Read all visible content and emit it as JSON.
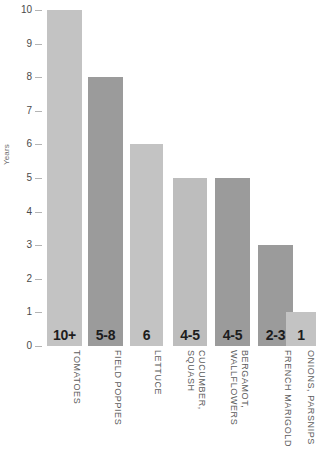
{
  "chart_data": {
    "type": "bar",
    "title": "",
    "xlabel": "",
    "ylabel": "Years",
    "ylim": [
      0,
      10
    ],
    "grid": false,
    "legend": "none",
    "y_ticks": [
      "10",
      "9",
      "8",
      "7",
      "6",
      "5",
      "4",
      "3",
      "2",
      "1",
      "0"
    ],
    "categories": [
      "TOMATOES",
      "FIELD POPPIES",
      "LETTUCE",
      "CUCUMBER, SQUASH",
      "BERGAMOT, WALLFLOWERS",
      "FRENCH MARIGOLD",
      "ONIONS, PARSNIPS"
    ],
    "category_lines": [
      [
        "TOMATOES"
      ],
      [
        "FIELD POPPIES"
      ],
      [
        "LETTUCE"
      ],
      [
        "CUCUMBER,",
        "SQUASH"
      ],
      [
        "BERGAMOT,",
        "WALLFLOWERS"
      ],
      [
        "FRENCH MARIGOLD"
      ],
      [
        "ONIONS, PARSNIPS"
      ]
    ],
    "values": [
      10,
      8,
      6,
      5,
      5,
      3,
      1
    ],
    "value_labels": [
      "10+",
      "5-8",
      "6",
      "4-5",
      "4-5",
      "2-3",
      "1"
    ],
    "bar_colors": [
      "#c3c3c3",
      "#9b9b9b",
      "#c3c3c3",
      "#bdbdbd",
      "#9b9b9b",
      "#9b9b9b",
      "#c3c3c3"
    ],
    "bar_geometry": [
      {
        "left": 0,
        "width": 35
      },
      {
        "left": 41,
        "width": 35
      },
      {
        "left": 83,
        "width": 33
      },
      {
        "left": 126,
        "width": 34
      },
      {
        "left": 168,
        "width": 35
      },
      {
        "left": 211,
        "width": 35
      },
      {
        "left": 239,
        "width": 0
      }
    ]
  },
  "colors": {
    "background": "#ffffff",
    "bar_light": "#c3c3c3",
    "bar_dark": "#9b9b9b",
    "tick_text": "#4a4a4a",
    "axis_title": "#6e6e6e",
    "category_text": "#5c5c5c",
    "value_text": "#1d1d1d"
  }
}
